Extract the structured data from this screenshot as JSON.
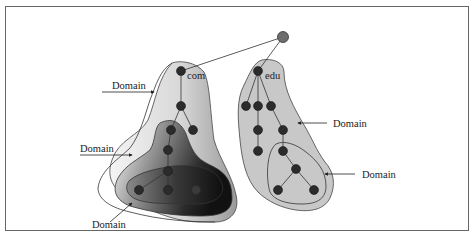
{
  "figure": {
    "root_node_color": "#6e6e6e",
    "node_color": "#2b2b2b",
    "region_fill": "#c8c8c8",
    "frame_color": "#555555",
    "domains": [
      {
        "id": "com",
        "label": "com"
      },
      {
        "id": "edu",
        "label": "edu"
      }
    ],
    "callouts": [
      {
        "id": "com-domain",
        "label": "Domain"
      },
      {
        "id": "com-sub-domain",
        "label": "Domain"
      },
      {
        "id": "com-subsub-domain",
        "label": "Domain"
      },
      {
        "id": "edu-domain",
        "label": "Domain"
      },
      {
        "id": "edu-sub-domain",
        "label": "Domain"
      }
    ]
  }
}
